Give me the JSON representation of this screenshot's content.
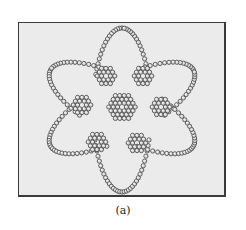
{
  "figure": {
    "caption": "(a)",
    "frame": {
      "x": 18,
      "y": 22,
      "w": 208,
      "h": 175
    },
    "colors": {
      "background": "#ebebeb",
      "bead_edge": "#505050",
      "bead_fill": "#d8d8d8",
      "bead_highlight": "#f4f4f4"
    },
    "bead_radius": 2.1,
    "bead_spacing": 4.4,
    "center": {
      "x": 122,
      "y": 108
    },
    "central_cluster": {
      "x": 122,
      "y": 107,
      "rings": 3
    },
    "hex_rings": [
      {
        "x": 106,
        "y": 76
      },
      {
        "x": 143,
        "y": 76
      },
      {
        "x": 82,
        "y": 105
      },
      {
        "x": 161,
        "y": 107
      },
      {
        "x": 97,
        "y": 142
      },
      {
        "x": 137,
        "y": 143
      }
    ],
    "orbit_loops": [
      {
        "cx": 122,
        "cy": 110,
        "a": 82,
        "b": 29,
        "angle_deg": 90
      },
      {
        "cx": 122,
        "cy": 108,
        "a": 81,
        "b": 29,
        "angle_deg": 28
      },
      {
        "cx": 122,
        "cy": 108,
        "a": 81,
        "b": 29,
        "angle_deg": 152
      }
    ]
  }
}
